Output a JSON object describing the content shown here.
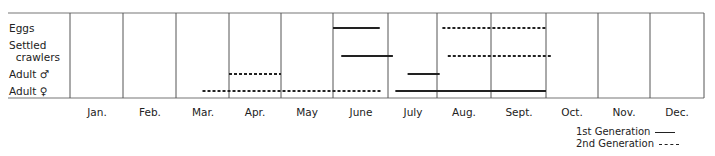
{
  "chart_data": {
    "type": "gantt",
    "title": "",
    "xlabel": "",
    "ylabel": "",
    "categories": [
      "Jan.",
      "Feb.",
      "Mar.",
      "Apr.",
      "May",
      "June",
      "July",
      "Aug.",
      "Sept.",
      "Oct.",
      "Nov.",
      "Dec."
    ],
    "rows": [
      "Eggs",
      "Settled\n  crawlers",
      "Adult ♂",
      "Adult ♀"
    ],
    "grid": true,
    "legend_position": "bottom-right",
    "legend": [
      {
        "name": "1st Generation",
        "style": "solid"
      },
      {
        "name": "2nd Generation",
        "style": "dashed"
      }
    ],
    "series": [
      {
        "name": "1st Generation",
        "style": "solid",
        "bars": [
          {
            "row": "Eggs",
            "start_month": 6.0,
            "end_month": 6.85
          },
          {
            "row": "Settled crawlers",
            "start_month": 6.15,
            "end_month": 7.1
          },
          {
            "row": "Adult ♂",
            "start_month": 7.4,
            "end_month": 8.05
          },
          {
            "row": "Adult ♀",
            "start_month": 7.15,
            "end_month": 10.0
          }
        ]
      },
      {
        "name": "2nd Generation",
        "style": "dashed",
        "bars": [
          {
            "row": "Eggs",
            "start_month": 8.1,
            "end_month": 10.0
          },
          {
            "row": "Settled crawlers",
            "start_month": 8.2,
            "end_month": 10.1
          },
          {
            "row": "Adult ♂",
            "start_month": 4.0,
            "end_month": 5.0
          },
          {
            "row": "Adult ♀",
            "start_month": 3.5,
            "end_month": 6.9
          }
        ]
      }
    ]
  },
  "labels": {
    "rows": [
      "Eggs",
      "Settled",
      "  crawlers",
      "Adult ♂",
      "Adult ♀"
    ],
    "months": [
      "Jan.",
      "Feb.",
      "Mar.",
      "Apr.",
      "May",
      "June",
      "July",
      "Aug.",
      "Sept.",
      "Oct.",
      "Nov.",
      "Dec."
    ],
    "legend_first": "1st Generation",
    "legend_second": "2nd Generation"
  },
  "colors": {
    "line": "#222222",
    "grid": "#555555",
    "frame": "#777777"
  }
}
